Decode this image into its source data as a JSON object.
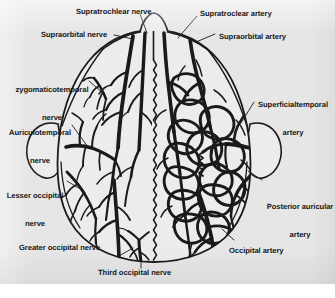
{
  "figure": {
    "background_color": "#e6e6e6",
    "ink_color": "#1a1a1a",
    "scalp_fill_color": "#ececec",
    "left_half": "nerves",
    "right_half": "arteries"
  },
  "labels": [
    {
      "id": "supratrochlear-nerve",
      "text": "Supratrochlear nerve",
      "side": "left",
      "structure": "nerve"
    },
    {
      "id": "supraorbital-nerve",
      "text": "Supraorbital nerve",
      "side": "left",
      "structure": "nerve"
    },
    {
      "id": "zygomaticotemporal-nerve",
      "text": "zygomaticotemporal",
      "text2": "nerve",
      "side": "left",
      "structure": "nerve"
    },
    {
      "id": "auriculotemporal-nerve",
      "text": "Auriculotemporal",
      "text2": "nerve",
      "side": "left",
      "structure": "nerve"
    },
    {
      "id": "lesser-occipital-nerve",
      "text": "Lesser occipital",
      "text2": "nerve",
      "side": "left",
      "structure": "nerve"
    },
    {
      "id": "greater-occipital-nerve",
      "text": "Greater occipital nerve",
      "side": "left",
      "structure": "nerve"
    },
    {
      "id": "third-occipital-nerve",
      "text": "Third occipital nerve",
      "side": "center",
      "structure": "nerve"
    },
    {
      "id": "supratroclear-artery",
      "text": "Supratroclear artery",
      "side": "right",
      "structure": "artery"
    },
    {
      "id": "supraorbital-artery",
      "text": "Supraorbital artery",
      "side": "right",
      "structure": "artery"
    },
    {
      "id": "superficialtemporal-artery",
      "text": "Superficialtemporal",
      "text2": "artery",
      "side": "right",
      "structure": "artery"
    },
    {
      "id": "posterior-auricular-artery",
      "text": "Posterior auricular",
      "text2": "artery",
      "side": "right",
      "structure": "artery"
    },
    {
      "id": "occipital-artery",
      "text": "Occipital artery",
      "side": "right",
      "structure": "artery"
    }
  ]
}
